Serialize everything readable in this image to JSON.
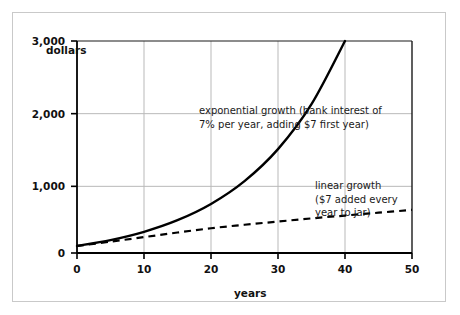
{
  "chart_data": {
    "type": "line",
    "title": "",
    "xlabel": "years",
    "ylabel": "dollars",
    "xlim": [
      0,
      50
    ],
    "ylim": [
      0,
      3000
    ],
    "grid": true,
    "legend_position": "inline-annotations",
    "xticks": [
      "0",
      "10",
      "20",
      "30",
      "40",
      "50"
    ],
    "xtick_values": [
      0,
      10,
      20,
      30,
      40,
      50
    ],
    "yticks": [
      "0",
      "1,000",
      "2,000",
      "3,000"
    ],
    "ytick_values": [
      0,
      1000,
      2000,
      3000
    ],
    "series": [
      {
        "name": "exponential growth",
        "style": "solid",
        "color": "#000000",
        "annotation": "exponential growth (bank interest of\n7% per year, adding $7 first year)",
        "x": [
          0,
          5,
          10,
          15,
          20,
          25,
          30,
          35,
          40,
          45,
          50
        ],
        "values": [
          100,
          183,
          300,
          464,
          694,
          1017,
          1470,
          2106,
          3000,
          4254,
          6016
        ],
        "visible_x_range": [
          0,
          50
        ],
        "endpoint_value": 3000
      },
      {
        "name": "linear growth",
        "style": "dashed",
        "color": "#000000",
        "annotation": "linear growth\n($7 added every\nyear to jar)",
        "x": [
          0,
          5,
          10,
          15,
          20,
          25,
          30,
          35,
          40,
          45,
          50
        ],
        "values": [
          100,
          160,
          225,
          290,
          350,
          400,
          445,
          490,
          530,
          570,
          610
        ],
        "endpoint_value": 610
      }
    ],
    "annotations": [
      {
        "id": "exponential-annotation",
        "line1": "exponential growth (bank interest of",
        "line2": "7% per year, adding $7 first year)"
      },
      {
        "id": "linear-annotation",
        "line1": "linear growth",
        "line2": "($7 added every",
        "line3": "year to jar)"
      }
    ],
    "colors": {
      "background": "#ffffff",
      "axis": "#000000",
      "gridline": "#b9b9b9",
      "frame_border": "#c9c9c9",
      "text": "#111111"
    }
  }
}
